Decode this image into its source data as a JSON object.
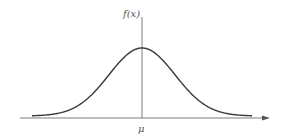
{
  "figure": {
    "type": "normal-distribution-diagram",
    "y_axis_label": "f(x)",
    "x_axis_tick_label": "μ",
    "colors": {
      "axis": "#6e6e6e",
      "curve": "#3a3a3a",
      "text": "#555555",
      "background": "#ffffff"
    }
  },
  "chart_data": {
    "type": "line",
    "title": "",
    "xlabel": "",
    "ylabel": "f(x)",
    "x_tick_labels": [
      "μ"
    ],
    "grid": false,
    "legend": null,
    "series": [
      {
        "name": "normal density curve",
        "shape": "bell curve symmetric about μ",
        "peak_at": "μ"
      }
    ]
  }
}
